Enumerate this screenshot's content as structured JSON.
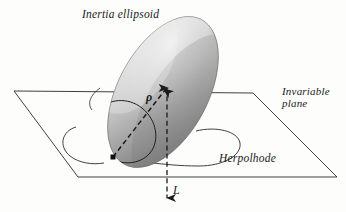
{
  "figure": {
    "type": "physics-diagram",
    "background_color": "#fdfdfc",
    "ink_color": "#1a1a1a",
    "ellipsoid_light": "#e2e2e2",
    "ellipsoid_dark": "#7c7c7c"
  },
  "labels": {
    "inertia_ellipsoid": "Inertia ellipsoid",
    "invariable_plane_line1": "Invariable",
    "invariable_plane_line2": "plane",
    "herpolhode": "Herpolhode",
    "rho": "ρ",
    "angular_momentum": "L"
  },
  "geometry": {
    "plane_corners": [
      [
        14,
        91
      ],
      [
        253,
        93
      ],
      [
        337,
        177
      ],
      [
        78,
        177
      ]
    ],
    "ellipsoid_center": [
      163,
      92
    ],
    "ellipsoid_rx": 45,
    "ellipsoid_ry": 82,
    "ellipsoid_tilt_deg": 28,
    "contact_point": [
      113,
      157
    ],
    "rho_arrow_start": [
      113,
      157
    ],
    "rho_arrow_end": [
      167,
      88
    ],
    "L_axis_top": [
      167,
      88
    ],
    "L_axis_bottom": [
      167,
      203
    ]
  }
}
